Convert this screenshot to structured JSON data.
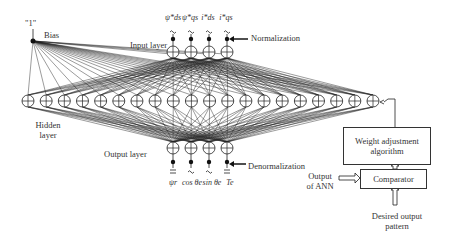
{
  "diagram": {
    "bias": {
      "value_label": "\"1\"",
      "label": "Bias"
    },
    "input_layer": {
      "label": "Input layer",
      "inputs": [
        "ψ*ds",
        "ψ*qs",
        "i*ds",
        "i*qs"
      ],
      "annotation": "Normalization",
      "node_count": 4
    },
    "hidden_layer": {
      "label": "Hidden layer",
      "label_line1": "Hidden",
      "label_line2": "layer",
      "node_count": 20
    },
    "output_layer": {
      "label": "Output layer",
      "outputs": [
        "ψr",
        "cos θe",
        "sin θe",
        "Te"
      ],
      "annotation": "Denormalization",
      "node_count": 4
    },
    "training": {
      "weight_adjustment_line1": "Weight adjustment",
      "weight_adjustment_line2": "algorithm",
      "comparator": "Comparator",
      "output_of_ann_line1": "Output",
      "output_of_ann_line2": "of ANN",
      "desired_output_line1": "Desired output",
      "desired_output_line2": "pattern"
    }
  }
}
